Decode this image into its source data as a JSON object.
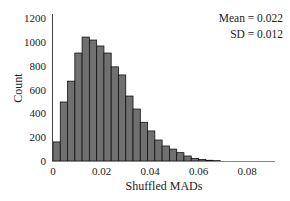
{
  "chart_data": {
    "type": "bar",
    "subtype": "histogram",
    "title": "",
    "xlabel": "Shuffled MADs",
    "ylabel": "Count",
    "xlim": [
      0,
      0.09
    ],
    "ylim": [
      0,
      1200
    ],
    "x_ticks": [
      0,
      0.02,
      0.04,
      0.06,
      0.08
    ],
    "x_tick_labels": [
      "0",
      "0.02",
      "0.04",
      "0.06",
      "0.08"
    ],
    "y_ticks": [
      0,
      200,
      400,
      600,
      800,
      1000,
      1200
    ],
    "y_tick_labels": [
      "0",
      "200",
      "400",
      "600",
      "800",
      "1000",
      "1200"
    ],
    "bin_width": 0.003,
    "bin_edges": [
      0,
      0.003,
      0.006,
      0.009,
      0.012,
      0.015,
      0.018,
      0.021,
      0.024,
      0.027,
      0.03,
      0.033,
      0.036,
      0.039,
      0.042,
      0.045,
      0.048,
      0.051,
      0.054,
      0.057,
      0.06,
      0.063,
      0.066,
      0.069
    ],
    "values": [
      160,
      495,
      670,
      906,
      1040,
      1015,
      965,
      906,
      790,
      722,
      545,
      436,
      325,
      252,
      176,
      126,
      100,
      70,
      42,
      22,
      12,
      6,
      3
    ],
    "annotations": [
      "Mean = 0.022",
      "SD = 0.012"
    ],
    "grid": false,
    "legend": null,
    "bar_color": "#707070",
    "bar_edge_color": "#111111"
  },
  "annotations": {
    "mean": "Mean = 0.022",
    "sd": "SD = 0.012"
  },
  "axes": {
    "xlabel": "Shuffled MADs",
    "ylabel": "Count"
  }
}
